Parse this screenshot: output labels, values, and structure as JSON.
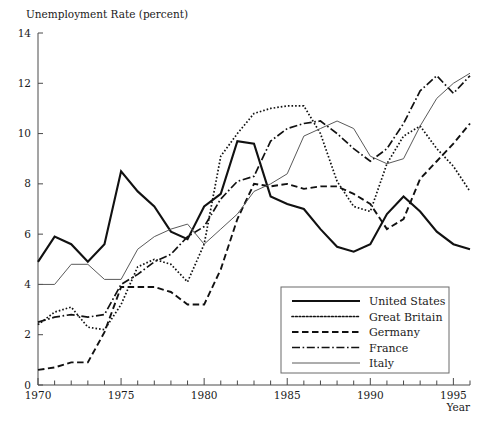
{
  "chart_data": {
    "type": "line",
    "title": "Unemployment Rate (percent)",
    "xlabel": "Year",
    "ylabel": "",
    "xlim": [
      1970,
      1996
    ],
    "ylim": [
      0,
      14
    ],
    "ytick_step": 2,
    "yticks": [
      0,
      2,
      4,
      6,
      8,
      10,
      12,
      14
    ],
    "ytick_labels": [
      "0",
      "2",
      "4",
      "6",
      "8",
      "10",
      "12",
      "14"
    ],
    "xticks_major": [
      1970,
      1975,
      1980,
      1985,
      1990,
      1995
    ],
    "xtick_labels": [
      "1970",
      "1975",
      "1980",
      "1985",
      "1990",
      "1995"
    ],
    "xtick_minor_step": 1,
    "grid": false,
    "legend_position": "bottom-right",
    "x": [
      1970,
      1971,
      1972,
      1973,
      1974,
      1975,
      1976,
      1977,
      1978,
      1979,
      1980,
      1981,
      1982,
      1983,
      1984,
      1985,
      1986,
      1987,
      1988,
      1989,
      1990,
      1991,
      1992,
      1993,
      1994,
      1995,
      1996
    ],
    "series": [
      {
        "name": "United States",
        "style": "solid-thick",
        "color": "#111111",
        "width": 2.1,
        "dash": "none",
        "values": [
          4.9,
          5.9,
          5.6,
          4.9,
          5.6,
          8.5,
          7.7,
          7.1,
          6.1,
          5.8,
          7.1,
          7.6,
          9.7,
          9.6,
          7.5,
          7.2,
          7.0,
          6.2,
          5.5,
          5.3,
          5.6,
          6.8,
          7.5,
          6.9,
          6.1,
          5.6,
          5.4
        ]
      },
      {
        "name": "Great Britain",
        "style": "dotted",
        "color": "#111111",
        "width": 1.7,
        "dash": "1.6,2.0",
        "values": [
          2.4,
          2.9,
          3.1,
          2.3,
          2.2,
          3.2,
          4.7,
          5.0,
          4.8,
          4.1,
          5.6,
          9.1,
          10.0,
          10.8,
          11.0,
          11.1,
          11.1,
          10.0,
          8.1,
          7.1,
          6.9,
          8.8,
          9.9,
          10.3,
          9.4,
          8.7,
          7.7
        ]
      },
      {
        "name": "Germany",
        "style": "dashed",
        "color": "#111111",
        "width": 1.9,
        "dash": "6.5,3.5",
        "values": [
          0.6,
          0.7,
          0.9,
          0.9,
          2.1,
          3.9,
          3.9,
          3.9,
          3.7,
          3.2,
          3.2,
          4.6,
          6.6,
          8.0,
          7.9,
          8.0,
          7.8,
          7.9,
          7.9,
          7.6,
          7.2,
          6.2,
          6.6,
          8.2,
          8.9,
          9.6,
          10.4
        ]
      },
      {
        "name": "France",
        "style": "dash-dot",
        "color": "#111111",
        "width": 1.7,
        "dash": "8,2.6,1.6,2.6",
        "values": [
          2.5,
          2.7,
          2.8,
          2.7,
          2.8,
          4.0,
          4.4,
          4.9,
          5.2,
          5.9,
          6.3,
          7.4,
          8.1,
          8.3,
          9.7,
          10.2,
          10.4,
          10.5,
          10.0,
          9.4,
          8.9,
          9.4,
          10.4,
          11.7,
          12.3,
          11.6,
          12.3
        ]
      },
      {
        "name": "Italy",
        "style": "solid-thin",
        "color": "#5a5a5a",
        "width": 1.0,
        "dash": "none",
        "values": [
          4.0,
          4.0,
          4.8,
          4.8,
          4.2,
          4.2,
          5.4,
          5.9,
          6.2,
          6.4,
          5.6,
          6.2,
          6.8,
          7.7,
          8.0,
          8.4,
          9.9,
          10.2,
          10.5,
          10.2,
          9.1,
          8.8,
          9.0,
          10.3,
          11.4,
          12.0,
          12.4
        ]
      }
    ]
  },
  "legend": {
    "items": [
      {
        "label": "United States"
      },
      {
        "label": "Great Britain"
      },
      {
        "label": "Germany"
      },
      {
        "label": "France"
      },
      {
        "label": "Italy"
      }
    ]
  }
}
